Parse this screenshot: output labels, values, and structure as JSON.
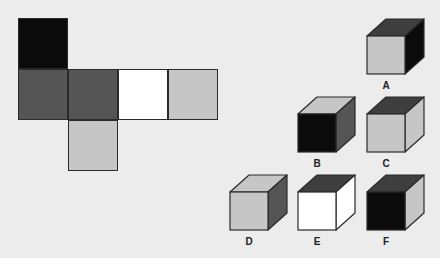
{
  "colors": {
    "black": "#0b0b0b",
    "dark": "#555555",
    "darker": "#3e3e3e",
    "white": "#ffffff",
    "light": "#c6c6c6",
    "stroke": "#2a2a2a"
  },
  "net": {
    "squares": [
      {
        "id": "net-top",
        "color": "black",
        "x": 18,
        "y": 18
      },
      {
        "id": "net-left",
        "color": "dark",
        "x": 18,
        "y": 69
      },
      {
        "id": "net-center",
        "color": "dark",
        "x": 68,
        "y": 69
      },
      {
        "id": "net-right-1",
        "color": "white",
        "x": 118,
        "y": 69
      },
      {
        "id": "net-right-2",
        "color": "light",
        "x": 168,
        "y": 69
      },
      {
        "id": "net-bottom",
        "color": "light",
        "x": 68,
        "y": 120
      }
    ]
  },
  "cubes": [
    {
      "label": "A",
      "x": 366,
      "y": 18,
      "front": "light",
      "top": "darker",
      "side": "black"
    },
    {
      "label": "B",
      "x": 297,
      "y": 96,
      "front": "black",
      "top": "light",
      "side": "dark"
    },
    {
      "label": "C",
      "x": 366,
      "y": 96,
      "front": "light",
      "top": "darker",
      "side": "light"
    },
    {
      "label": "D",
      "x": 229,
      "y": 174,
      "front": "light",
      "top": "light",
      "side": "dark"
    },
    {
      "label": "E",
      "x": 297,
      "y": 174,
      "front": "white",
      "top": "darker",
      "side": "white"
    },
    {
      "label": "F",
      "x": 366,
      "y": 174,
      "front": "black",
      "top": "darker",
      "side": "light"
    }
  ]
}
